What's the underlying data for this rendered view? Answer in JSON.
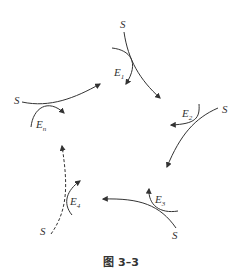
{
  "figure": {
    "caption": "图 3–3",
    "stroke_color": "#333333",
    "background": "#ffffff"
  },
  "labels": {
    "s_top": "S",
    "e1": "E",
    "e1_sub": "1",
    "s_right": "S",
    "e2": "E",
    "e2_sub": "2",
    "s_left": "S",
    "en": "E",
    "en_sub": "n",
    "e3": "E",
    "e3_sub": "3",
    "s_bottom_right": "S",
    "e4": "E",
    "e4_sub": "4",
    "s_bottom_left": "S"
  }
}
